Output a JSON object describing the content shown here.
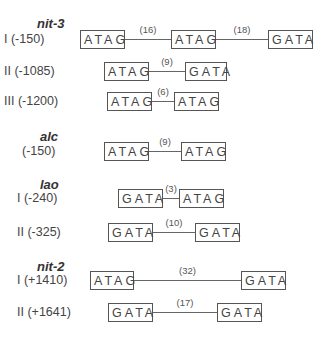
{
  "genes": [
    {
      "name": "nit-3",
      "x": 37,
      "y": 16,
      "sites": [
        {
          "label": "I (-150)",
          "lx": 4,
          "y": 30,
          "boxes": [
            {
              "text": "ATAG",
              "x": 80,
              "w": 45
            },
            {
              "text": "ATAG",
              "x": 171,
              "w": 45
            },
            {
              "text": "GATA",
              "x": 268,
              "w": 45
            }
          ],
          "gaps": [
            "(16)",
            "(18)"
          ]
        },
        {
          "label": "II (-1085)",
          "lx": 4,
          "y": 62,
          "boxes": [
            {
              "text": "ATAG",
              "x": 104,
              "w": 45
            },
            {
              "text": "GATA",
              "x": 185,
              "w": 42
            }
          ],
          "gaps": [
            "(9)"
          ]
        },
        {
          "label": "III (-1200)",
          "lx": 4,
          "y": 92,
          "boxes": [
            {
              "text": "ATAG",
              "x": 107,
              "w": 45
            },
            {
              "text": "ATAG",
              "x": 174,
              "w": 45
            }
          ],
          "gaps": [
            "(6)"
          ]
        }
      ]
    },
    {
      "name": "alc",
      "x": 40,
      "y": 129,
      "sites": [
        {
          "label": "(-150)",
          "lx": 22,
          "y": 142,
          "boxes": [
            {
              "text": "ATAG",
              "x": 104,
              "w": 45
            },
            {
              "text": "ATAG",
              "x": 181,
              "w": 45
            }
          ],
          "gaps": [
            "(9)"
          ]
        }
      ]
    },
    {
      "name": "lao",
      "x": 40,
      "y": 177,
      "sites": [
        {
          "label": "I (-240)",
          "lx": 17,
          "y": 189,
          "boxes": [
            {
              "text": "GATA",
              "x": 118,
              "w": 45
            },
            {
              "text": "ATAG",
              "x": 179,
              "w": 45
            }
          ],
          "gaps": [
            "(3)"
          ]
        },
        {
          "label": "II (-325)",
          "lx": 17,
          "y": 223,
          "boxes": [
            {
              "text": "GATA",
              "x": 108,
              "w": 45
            },
            {
              "text": "GATA",
              "x": 195,
              "w": 45
            }
          ],
          "gaps": [
            "(10)"
          ]
        }
      ]
    },
    {
      "name": "nit-2",
      "x": 37,
      "y": 259,
      "sites": [
        {
          "label": "I (+1410)",
          "lx": 17,
          "y": 271,
          "boxes": [
            {
              "text": "ATAG",
              "x": 90,
              "w": 44
            },
            {
              "text": "GATA",
              "x": 241,
              "w": 45
            }
          ],
          "gaps": [
            "(32)"
          ]
        },
        {
          "label": "II (+1641)",
          "lx": 17,
          "y": 303,
          "boxes": [
            {
              "text": "GATA",
              "x": 108,
              "w": 45
            },
            {
              "text": "GATA",
              "x": 217,
              "w": 45
            }
          ],
          "gaps": [
            "(17)"
          ]
        }
      ]
    }
  ]
}
